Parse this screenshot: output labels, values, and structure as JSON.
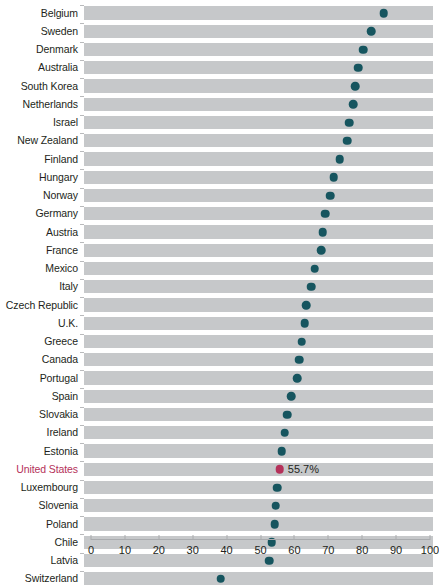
{
  "chart_data": {
    "type": "scatter",
    "title": "",
    "subtitle": "",
    "xlabel": "",
    "ylabel": "",
    "xlim": [
      0,
      100
    ],
    "xticks": [
      0,
      10,
      20,
      30,
      40,
      50,
      60,
      70,
      80,
      90,
      100
    ],
    "grid": false,
    "legend": null,
    "orientation": "horizontal",
    "categories": [
      "Belgium",
      "Sweden",
      "Denmark",
      "Australia",
      "South Korea",
      "Netherlands",
      "Israel",
      "New Zealand",
      "Finland",
      "Hungary",
      "Norway",
      "Germany",
      "Austria",
      "France",
      "Mexico",
      "Italy",
      "Czech Republic",
      "U.K.",
      "Greece",
      "Canada",
      "Portugal",
      "Spain",
      "Slovakia",
      "Ireland",
      "Estonia",
      "United States",
      "Luxembourg",
      "Slovenia",
      "Poland",
      "Chile",
      "Latvia",
      "Switzerland"
    ],
    "values": [
      86.4,
      82.6,
      80.3,
      78.8,
      77.9,
      77.3,
      76.1,
      75.6,
      73.4,
      71.6,
      70.6,
      69.1,
      68.3,
      67.9,
      66.0,
      64.9,
      63.4,
      63.0,
      62.1,
      61.4,
      60.8,
      59.0,
      57.9,
      57.1,
      56.2,
      55.7,
      55.0,
      54.5,
      54.2,
      53.3,
      52.6,
      38.3
    ],
    "highlight": {
      "category": "United States",
      "value": 55.7,
      "label": "55.7%",
      "color": "#b5315a"
    },
    "series_color": "#16555f",
    "band_color": "#c6c8ca",
    "axis_color": "#a9abae"
  }
}
